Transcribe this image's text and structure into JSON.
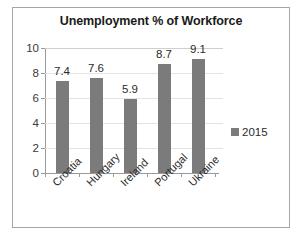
{
  "chart_data": {
    "type": "bar",
    "title": "Unemployment % of Workforce",
    "xlabel": "",
    "ylabel": "",
    "categories": [
      "Croatia",
      "Hungary",
      "Ireland",
      "Portugal",
      "Ukraine"
    ],
    "series": [
      {
        "name": "2015",
        "values": [
          7.4,
          7.6,
          5.9,
          8.7,
          9.1
        ]
      }
    ],
    "value_labels": [
      "7.4",
      "7.6",
      "5.9",
      "8.7",
      "9.1"
    ],
    "ylim": [
      0,
      10
    ],
    "ytick_values": [
      0,
      2,
      4,
      6,
      8,
      10
    ],
    "ytick_labels": [
      "0",
      "2",
      "4",
      "6",
      "8",
      "10"
    ],
    "grid": "horizontal",
    "legend_position": "right",
    "legend_entries": [
      "2015"
    ],
    "category_label_rotation": -45,
    "colors": {
      "bar": "#7b7b7b",
      "gridline": "#e3e3e3",
      "axis": "#9a9a9a",
      "frame": "#a6a6a6",
      "title_text": "#1a1a1a",
      "label_text": "#2b2b2b",
      "background": "#ffffff"
    }
  }
}
